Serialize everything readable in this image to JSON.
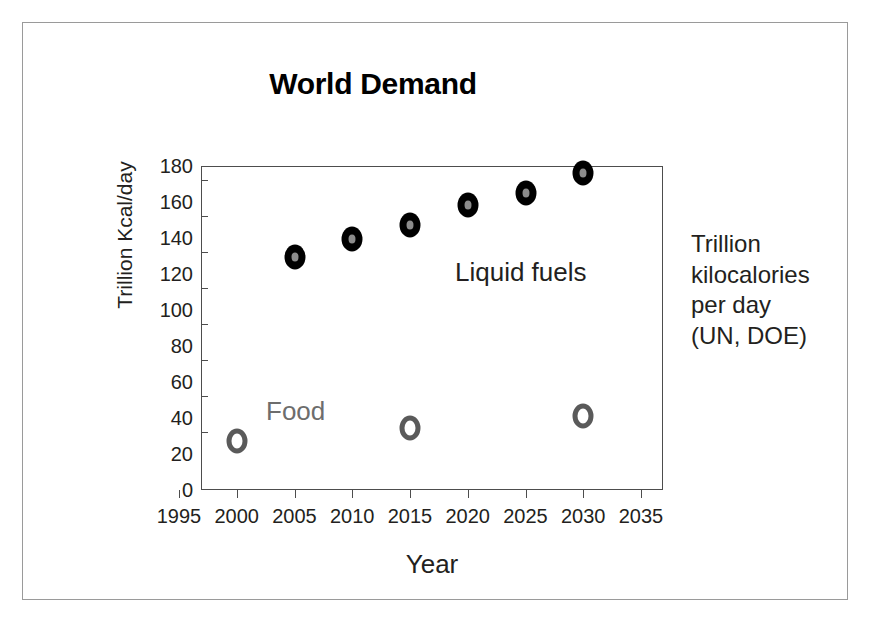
{
  "figure": {
    "title": "World Demand",
    "frame_color": "#9a9a9a",
    "background": "#ffffff"
  },
  "side_note": {
    "line1": "Trillion",
    "line2": "kilocalories",
    "line3": "per day",
    "line4": "(UN, DOE)"
  },
  "series_labels": {
    "liquid": "Liquid fuels",
    "food": "Food"
  },
  "chart_data": {
    "type": "scatter",
    "title": "World Demand",
    "xlabel": "Year",
    "ylabel": "Trillion Kcal/day",
    "xlim": [
      1995,
      2035
    ],
    "ylim": [
      0,
      180
    ],
    "xticks": [
      1995,
      2000,
      2005,
      2010,
      2015,
      2020,
      2025,
      2030,
      2035
    ],
    "yticks": [
      0,
      20,
      40,
      60,
      80,
      100,
      120,
      140,
      160,
      180
    ],
    "grid": false,
    "legend": "inline-annotations",
    "annotations": [
      {
        "text": "Liquid fuels",
        "x": 2021,
        "y": 122,
        "color": "#231f20"
      },
      {
        "text": "Food",
        "x": 2003,
        "y": 42,
        "color": "#6d6d6d"
      },
      {
        "text": "Trillion kilocalories per day (UN, DOE)",
        "position": "right-outside",
        "color": "#231f20"
      }
    ],
    "series": [
      {
        "name": "Liquid fuels",
        "marker": "filled-black-ring-with-gray-center",
        "color": "#000000",
        "x": [
          2005,
          2010,
          2015,
          2020,
          2025,
          2030
        ],
        "values": [
          117,
          127,
          135,
          146,
          153,
          164
        ]
      },
      {
        "name": "Food",
        "marker": "hollow-gray-ring",
        "color": "#5a5a5a",
        "x": [
          2000,
          2015,
          2030
        ],
        "values": [
          15,
          22,
          29
        ]
      }
    ]
  }
}
